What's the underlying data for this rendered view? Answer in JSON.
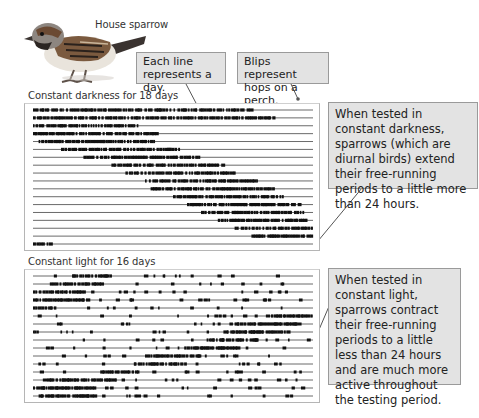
{
  "bird": {
    "label": "House sparrow"
  },
  "callouts": {
    "each_line": "Each line represents a day.",
    "blips": "Blips represent hops on a perch.",
    "darkness_note": "When tested in constant darkness, sparrows (which are diurnal birds) extend their free-running periods to a little more than 24 hours.",
    "light_note": "When tested in constant light, sparrows contract their free-running periods to a little less than 24 hours and are much more active throughout the testing period."
  },
  "panels": {
    "darkness": {
      "title": "Constant darkness for 18 days",
      "days": 18
    },
    "light": {
      "title": "Constant light for 16 days",
      "days": 16
    }
  },
  "chart_data": [
    {
      "type": "table",
      "title": "Constant darkness for 18 days",
      "description": "Actogram: each row is one day; dark blips are perch hops. Activity onset drifts later each day (period slightly > 24 h).",
      "rows": 18,
      "activity_bands_fraction_of_width": [
        [
          0.0,
          0.78
        ],
        [
          0.0,
          0.86
        ],
        [
          0.0,
          0.38
        ],
        [
          0.0,
          0.45
        ],
        [
          0.02,
          0.44
        ],
        [
          0.1,
          0.52
        ],
        [
          0.18,
          0.6
        ],
        [
          0.28,
          0.68
        ],
        [
          0.33,
          0.72
        ],
        [
          0.4,
          0.8
        ],
        [
          0.42,
          0.86
        ],
        [
          0.5,
          0.9
        ],
        [
          0.55,
          0.95
        ],
        [
          0.6,
          0.97
        ],
        [
          0.66,
          0.98
        ],
        [
          0.72,
          1.0
        ],
        [
          0.78,
          0.99
        ],
        [
          0.0,
          0.06
        ]
      ],
      "xlabel": "",
      "ylabel": ""
    },
    {
      "type": "table",
      "title": "Constant light for 16 days",
      "description": "Actogram: each row is one day; main activity band drifts earlier each day (period slightly < 24 h), with many scattered hops throughout.",
      "rows": 16,
      "activity_bands_fraction_of_width": [
        [
          0.14,
          0.28
        ],
        [
          0.06,
          0.24
        ],
        [
          0.0,
          0.18
        ],
        [
          0.0,
          0.2
        ],
        [
          0.0,
          0.08
        ],
        [
          0.85,
          1.0
        ],
        [
          0.72,
          0.93
        ],
        [
          0.68,
          0.91
        ],
        [
          0.62,
          0.8
        ],
        [
          0.54,
          0.73
        ],
        [
          0.4,
          0.6
        ],
        [
          0.36,
          0.54
        ],
        [
          0.24,
          0.38
        ],
        [
          0.05,
          0.3
        ],
        [
          0.0,
          0.22
        ],
        [
          0.02,
          0.22
        ]
      ],
      "xlabel": "",
      "ylabel": ""
    }
  ]
}
